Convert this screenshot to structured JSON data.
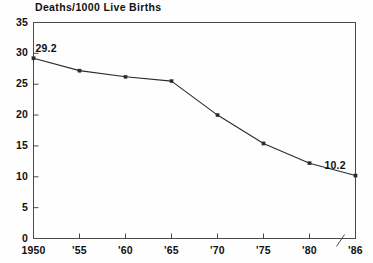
{
  "chart_data": {
    "type": "line",
    "title": "Deaths/1000 Live Births",
    "xlabel": "",
    "ylabel": "",
    "x": [
      1950,
      1955,
      1960,
      1965,
      1970,
      1975,
      1980,
      1986
    ],
    "categories": [
      "1950",
      "'55",
      "'60",
      "'65",
      "'70",
      "'75",
      "'80",
      "'86"
    ],
    "values": [
      29.2,
      27.2,
      26.2,
      25.5,
      20.0,
      15.4,
      12.2,
      10.2
    ],
    "series": [
      {
        "name": "Infant mortality rate",
        "values": [
          29.2,
          27.2,
          26.2,
          25.5,
          20.0,
          15.4,
          12.2,
          10.2
        ]
      }
    ],
    "ylim": [
      0,
      35
    ],
    "yticks": [
      0,
      5,
      10,
      15,
      20,
      25,
      30,
      35
    ],
    "ytick_labels": [
      "0",
      "5",
      "10",
      "15",
      "20",
      "25",
      "30",
      "35"
    ],
    "xtick_labels": [
      "1950",
      "'55",
      "'60",
      "'65",
      "'70",
      "'75",
      "'80",
      "'86"
    ],
    "grid": false,
    "legend": "none",
    "marker": "square",
    "line_color": "#2b2b2b",
    "axis_color": "#4a4a4a",
    "background_color": "#fefefe",
    "axis_break": {
      "present": true,
      "between": [
        "'80",
        "'86"
      ],
      "style": "diagonal-slash"
    },
    "annotations": [
      {
        "text": "29.2",
        "x": 1950,
        "y": 29.2,
        "position": "above-right"
      },
      {
        "text": "10.2",
        "x": 1986,
        "y": 10.2,
        "position": "above-left"
      }
    ]
  }
}
